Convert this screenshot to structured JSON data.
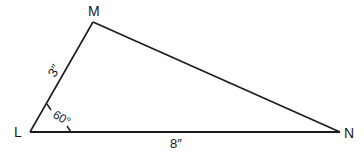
{
  "diagram": {
    "type": "triangle",
    "stroke_color": "#1a1a1a",
    "vertices": [
      {
        "id": "L",
        "label": "L",
        "x": 30,
        "y": 132
      },
      {
        "id": "M",
        "label": "M",
        "x": 93,
        "y": 22
      },
      {
        "id": "N",
        "label": "N",
        "x": 340,
        "y": 132
      }
    ],
    "sides": [
      {
        "from": "L",
        "to": "M",
        "label": "3″"
      },
      {
        "from": "M",
        "to": "N",
        "label": ""
      },
      {
        "from": "L",
        "to": "N",
        "label": "8″"
      }
    ],
    "angles": [
      {
        "vertex": "L",
        "label": "60°"
      }
    ]
  }
}
